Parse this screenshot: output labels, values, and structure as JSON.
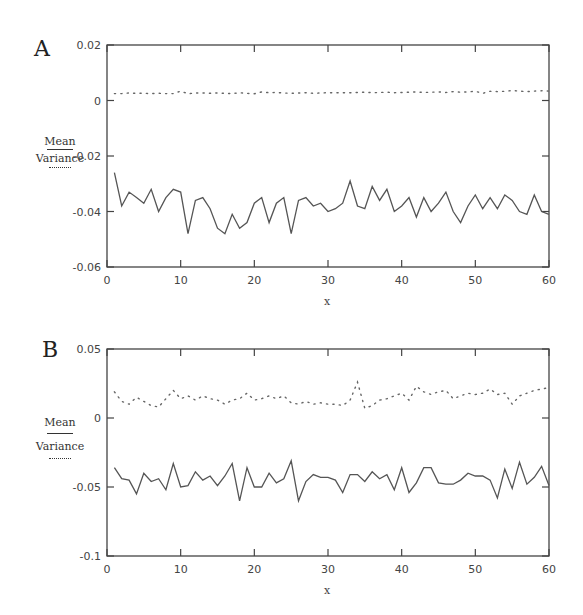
{
  "chart_data": [
    {
      "panel": "A",
      "type": "line",
      "title": "",
      "xlabel": "x",
      "ylabel": "",
      "xlim": [
        0,
        60
      ],
      "ylim": [
        -0.06,
        0.02
      ],
      "x_ticks": [
        "0",
        "10",
        "20",
        "30",
        "40",
        "50",
        "60"
      ],
      "y_ticks": [
        "0.02",
        "0",
        "-0.02",
        "-0.04",
        "-0.06"
      ],
      "grid": false,
      "legend": {
        "position": "left",
        "entries": [
          {
            "label": "Mean",
            "style": "solid"
          },
          {
            "label": "Variance",
            "style": "dotted"
          }
        ]
      },
      "x": [
        1,
        2,
        3,
        4,
        5,
        6,
        7,
        8,
        9,
        10,
        11,
        12,
        13,
        14,
        15,
        16,
        17,
        18,
        19,
        20,
        21,
        22,
        23,
        24,
        25,
        26,
        27,
        28,
        29,
        30,
        31,
        32,
        33,
        34,
        35,
        36,
        37,
        38,
        39,
        40,
        41,
        42,
        43,
        44,
        45,
        46,
        47,
        48,
        49,
        50,
        51,
        52,
        53,
        54,
        55,
        56,
        57,
        58,
        59,
        60
      ],
      "series": [
        {
          "name": "Mean",
          "style": "solid",
          "values": [
            -0.026,
            -0.038,
            -0.033,
            -0.035,
            -0.037,
            -0.032,
            -0.04,
            -0.035,
            -0.032,
            -0.033,
            -0.048,
            -0.036,
            -0.035,
            -0.039,
            -0.046,
            -0.048,
            -0.041,
            -0.046,
            -0.044,
            -0.037,
            -0.035,
            -0.044,
            -0.037,
            -0.035,
            -0.048,
            -0.036,
            -0.035,
            -0.038,
            -0.037,
            -0.04,
            -0.039,
            -0.037,
            -0.029,
            -0.038,
            -0.039,
            -0.031,
            -0.036,
            -0.032,
            -0.04,
            -0.038,
            -0.035,
            -0.042,
            -0.035,
            -0.04,
            -0.037,
            -0.033,
            -0.04,
            -0.044,
            -0.038,
            -0.034,
            -0.039,
            -0.035,
            -0.039,
            -0.034,
            -0.036,
            -0.04,
            -0.041,
            -0.034,
            -0.04,
            -0.041
          ]
        },
        {
          "name": "Variance",
          "style": "dotted",
          "values": [
            0.0025,
            0.0025,
            0.0027,
            0.0026,
            0.0026,
            0.0025,
            0.0026,
            0.0025,
            0.0025,
            0.0034,
            0.0024,
            0.0027,
            0.0027,
            0.0026,
            0.0027,
            0.0026,
            0.0025,
            0.0028,
            0.0026,
            0.0024,
            0.0031,
            0.0028,
            0.0029,
            0.0027,
            0.0026,
            0.0027,
            0.0028,
            0.0026,
            0.0027,
            0.0028,
            0.0028,
            0.0028,
            0.0028,
            0.0029,
            0.003,
            0.0028,
            0.0029,
            0.003,
            0.0028,
            0.0029,
            0.003,
            0.0031,
            0.0029,
            0.003,
            0.0031,
            0.0029,
            0.0032,
            0.003,
            0.0031,
            0.0033,
            0.0026,
            0.0033,
            0.0032,
            0.0033,
            0.0036,
            0.0034,
            0.0032,
            0.0034,
            0.0035,
            0.0034
          ]
        }
      ]
    },
    {
      "panel": "B",
      "type": "line",
      "title": "",
      "xlabel": "x",
      "ylabel": "",
      "xlim": [
        0,
        60
      ],
      "ylim": [
        -0.1,
        0.05
      ],
      "x_ticks": [
        "0",
        "10",
        "20",
        "30",
        "40",
        "50",
        "60"
      ],
      "y_ticks": [
        "0.05",
        "0",
        "-0.05",
        "-0.1"
      ],
      "grid": false,
      "legend": {
        "position": "left",
        "entries": [
          {
            "label": "Mean",
            "style": "solid"
          },
          {
            "label": "Variance",
            "style": "dotted"
          }
        ]
      },
      "x": [
        1,
        2,
        3,
        4,
        5,
        6,
        7,
        8,
        9,
        10,
        11,
        12,
        13,
        14,
        15,
        16,
        17,
        18,
        19,
        20,
        21,
        22,
        23,
        24,
        25,
        26,
        27,
        28,
        29,
        30,
        31,
        32,
        33,
        34,
        35,
        36,
        37,
        38,
        39,
        40,
        41,
        42,
        43,
        44,
        45,
        46,
        47,
        48,
        49,
        50,
        51,
        52,
        53,
        54,
        55,
        56,
        57,
        58,
        59,
        60
      ],
      "series": [
        {
          "name": "Mean",
          "style": "solid",
          "values": [
            -0.036,
            -0.044,
            -0.045,
            -0.055,
            -0.04,
            -0.046,
            -0.044,
            -0.052,
            -0.033,
            -0.05,
            -0.049,
            -0.039,
            -0.045,
            -0.042,
            -0.049,
            -0.042,
            -0.033,
            -0.06,
            -0.036,
            -0.05,
            -0.05,
            -0.04,
            -0.047,
            -0.044,
            -0.031,
            -0.06,
            -0.046,
            -0.041,
            -0.043,
            -0.043,
            -0.045,
            -0.054,
            -0.041,
            -0.041,
            -0.046,
            -0.039,
            -0.044,
            -0.041,
            -0.052,
            -0.036,
            -0.054,
            -0.047,
            -0.036,
            -0.036,
            -0.047,
            -0.048,
            -0.048,
            -0.045,
            -0.04,
            -0.042,
            -0.042,
            -0.045,
            -0.058,
            -0.037,
            -0.051,
            -0.032,
            -0.048,
            -0.043,
            -0.035,
            -0.049
          ]
        },
        {
          "name": "Variance",
          "style": "dotted",
          "values": [
            0.019,
            0.012,
            0.01,
            0.015,
            0.012,
            0.009,
            0.008,
            0.014,
            0.02,
            0.014,
            0.016,
            0.013,
            0.016,
            0.014,
            0.013,
            0.01,
            0.013,
            0.014,
            0.018,
            0.013,
            0.014,
            0.016,
            0.014,
            0.016,
            0.011,
            0.01,
            0.012,
            0.01,
            0.011,
            0.01,
            0.01,
            0.009,
            0.013,
            0.026,
            0.007,
            0.009,
            0.013,
            0.014,
            0.016,
            0.018,
            0.013,
            0.023,
            0.019,
            0.017,
            0.019,
            0.02,
            0.014,
            0.016,
            0.018,
            0.017,
            0.018,
            0.021,
            0.017,
            0.018,
            0.01,
            0.016,
            0.018,
            0.02,
            0.021,
            0.022
          ]
        }
      ]
    }
  ],
  "panels": {
    "a": {
      "letter": "A",
      "legend_mean": "Mean",
      "legend_variance": "Variance",
      "xlabel": "x"
    },
    "b": {
      "letter": "B",
      "legend_mean": "Mean",
      "legend_variance": "Variance",
      "xlabel": "x"
    }
  }
}
